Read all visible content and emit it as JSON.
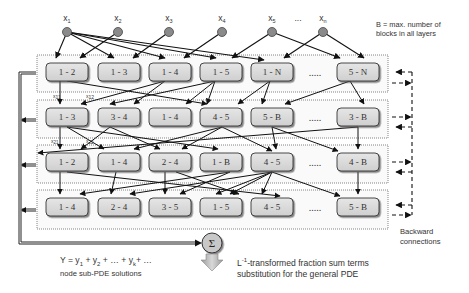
{
  "inputs": [
    {
      "label": "x",
      "sub": "1",
      "x": 67
    },
    {
      "label": "x",
      "sub": "2",
      "x": 118
    },
    {
      "label": "x",
      "sub": "3",
      "x": 169
    },
    {
      "label": "x",
      "sub": "4",
      "x": 222
    },
    {
      "label": "x",
      "sub": "5",
      "x": 272
    },
    {
      "label": "...",
      "sub": "",
      "x": 298
    },
    {
      "label": "x",
      "sub": "n",
      "x": 323
    }
  ],
  "legend_note": {
    "line1": "B = max. number of",
    "line2": "blocks in all layers"
  },
  "layers": [
    {
      "nodes": [
        "1 - 2",
        "1 - 3",
        "1 - 4",
        "1 - 5",
        "1 - N",
        "5 - N"
      ],
      "ellipsis": "....."
    },
    {
      "nodes": [
        "1 - 3",
        "3 - 4",
        "1 - 4",
        "4 - 5",
        "5 - B",
        "3 - B"
      ],
      "ellipsis": "....."
    },
    {
      "nodes": [
        "1 - 2",
        "1 - 4",
        "2 - 4",
        "1 - B",
        "4 - 5",
        "4 - B"
      ],
      "ellipsis": "....."
    },
    {
      "nodes": [
        "1 - 4",
        "2 - 4",
        "3 - 5",
        "1 - 5",
        "4 - 5",
        "5 - B"
      ],
      "ellipsis": "....."
    }
  ],
  "inter_layer_labels": {
    "x11": {
      "label": "x",
      "sub": "11"
    },
    "x12": {
      "label": "x",
      "sub": "12"
    },
    "x21": {
      "label": "x",
      "sub": "21"
    },
    "x22": {
      "label": "x",
      "sub": "22"
    }
  },
  "sum_node": {
    "symbol": "Σ"
  },
  "backward_note": {
    "line1": "Backward",
    "line2": "connections"
  },
  "output_formula": {
    "prefix": "Y = y",
    "s1": "1",
    "mid1": " + y",
    "s2": "2",
    "mid2": " + … + y",
    "sk": "k",
    "suffix": "+ …",
    "caption": "node sub-PDE solutions"
  },
  "transform_note": {
    "L": "L",
    "sup": "-1",
    "line1_rest": "-transformed fraction sum terms",
    "line2": "substitution for the general PDE"
  },
  "colors": {
    "node_fill": "#d9d9d9",
    "node_stroke": "#3a3a3a",
    "input_fill": "#8a8a8a",
    "arrow": "#111111",
    "layer_border": "#777777",
    "sum_fill": "#c8c8c8"
  }
}
